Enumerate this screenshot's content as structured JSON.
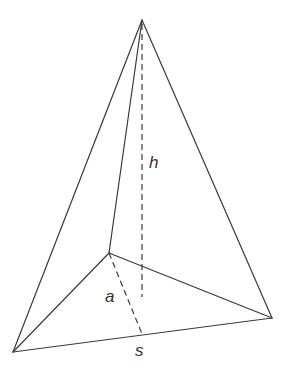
{
  "diagram": {
    "stroke_color": "#3a3a3a",
    "background": "#ffffff",
    "vertices": {
      "apex": [
        142,
        20
      ],
      "back": [
        109,
        253
      ],
      "left": [
        13,
        352
      ],
      "right": [
        272,
        318
      ]
    },
    "labels": {
      "height": "h",
      "apothem": "a",
      "side": "s"
    }
  }
}
